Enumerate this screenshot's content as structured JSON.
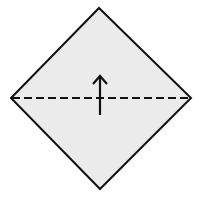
{
  "diagram": {
    "type": "origami-fold-step",
    "shape": "square-on-point",
    "vertices": {
      "top": [
        99,
        8
      ],
      "left": [
        11,
        98
      ],
      "right": [
        191,
        98
      ],
      "bottom": [
        100,
        189
      ]
    },
    "fill_color": "#ebebeb",
    "stroke_color": "#111111",
    "fold_line": {
      "style": "valley-fold-dashed",
      "from": [
        11,
        98
      ],
      "to": [
        191,
        98
      ]
    },
    "arrow": {
      "direction": "up",
      "x": 100,
      "y_start": 115,
      "y_end": 75
    }
  }
}
